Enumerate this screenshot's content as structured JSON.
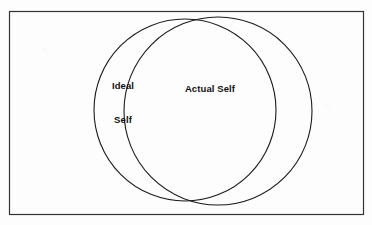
{
  "figure": {
    "type": "venn-diagram",
    "title_visible": false,
    "frame": {
      "border_color": "#333333",
      "border_width_px": 1,
      "x": 9,
      "y": 11,
      "width": 354,
      "height": 203
    },
    "background_color": "#fdfdfd",
    "stroke_color": "#1a1a1a",
    "fill": "none",
    "text_color": "#111111"
  },
  "circles": [
    {
      "id": "ideal-self",
      "label_lines": [
        "Ideal",
        "Self"
      ],
      "label_text": "Ideal Self",
      "cx": 185,
      "cy": 110,
      "r": 91
    },
    {
      "id": "actual-self",
      "label_lines": [
        "Actual Self"
      ],
      "label_text": "Actual Self",
      "cx": 218,
      "cy": 111,
      "r": 94
    }
  ],
  "labels": {
    "ideal_line1": "Ideal",
    "ideal_line2": "Self",
    "actual": "Actual Self"
  }
}
